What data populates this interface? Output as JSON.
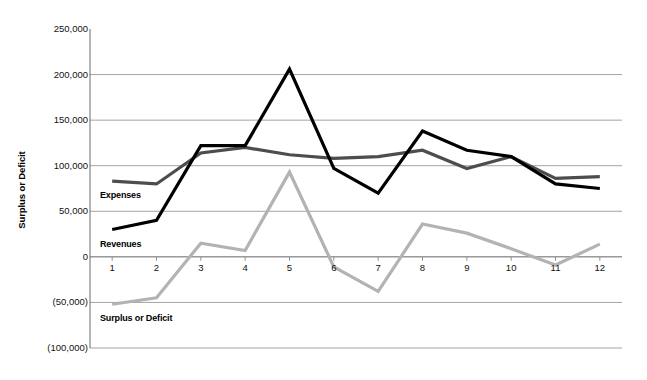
{
  "chart_data": {
    "type": "line",
    "title": "",
    "xlabel": "",
    "ylabel": "Surplus or Deficit",
    "x": [
      1,
      2,
      3,
      4,
      5,
      6,
      7,
      8,
      9,
      10,
      11,
      12
    ],
    "categories": [
      "1",
      "2",
      "3",
      "4",
      "5",
      "6",
      "7",
      "8",
      "9",
      "10",
      "11",
      "12"
    ],
    "ylim": [
      -100000,
      250000
    ],
    "ytick_values": [
      250000,
      200000,
      150000,
      100000,
      50000,
      0,
      -50000,
      -100000
    ],
    "ytick_labels": [
      "250,000",
      "200,000",
      "150,000",
      "100,000",
      "50,000",
      "0",
      "(50,000)",
      "(100,000)"
    ],
    "grid": true,
    "grid_axis": "y",
    "legend": "inline-labels",
    "series": [
      {
        "name": "Revenues",
        "color": "#000000",
        "width": 3.2,
        "values": [
          30000,
          40000,
          122000,
          122000,
          206000,
          97000,
          70000,
          138000,
          117000,
          110000,
          80000,
          75000
        ]
      },
      {
        "name": "Expenses",
        "color": "#4d4d4d",
        "width": 3.2,
        "values": [
          83000,
          80000,
          114000,
          120000,
          112000,
          108000,
          110000,
          117000,
          97000,
          110000,
          86000,
          88000
        ]
      },
      {
        "name": "Surplus or Deficit",
        "color": "#b3b3b3",
        "width": 3.2,
        "values": [
          -52000,
          -45000,
          15000,
          7000,
          93000,
          -11000,
          -38000,
          36000,
          26000,
          9000,
          -9000,
          14000
        ]
      }
    ],
    "inline_labels": [
      {
        "text": "Expenses",
        "x_px": 100,
        "y_px": 190
      },
      {
        "text": "Revenues",
        "x_px": 100,
        "y_px": 239
      },
      {
        "text": "Surplus or Deficit",
        "x_px": 100,
        "y_px": 313
      }
    ]
  },
  "axis": {
    "y_title": "Surplus or Deficit"
  }
}
